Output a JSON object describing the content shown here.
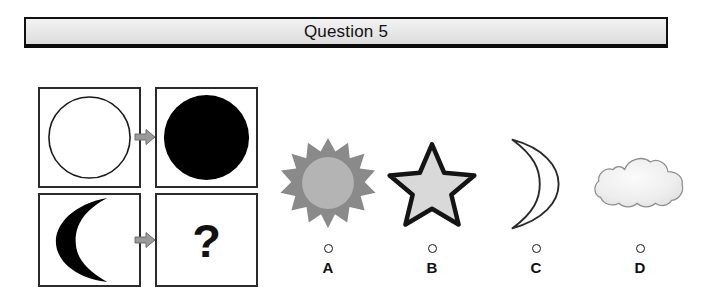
{
  "header": {
    "title": "Question 5"
  },
  "matrix": {
    "name": "analogy-matrix",
    "rows": [
      {
        "source": {
          "shape": "circle-outline",
          "fill": "#ffffff",
          "stroke": "#1a1a1a"
        },
        "arrow": "right-arrow-icon",
        "target": {
          "shape": "circle-filled",
          "fill": "#000000"
        }
      },
      {
        "source": {
          "shape": "crescent-filled",
          "fill": "#000000"
        },
        "arrow": "right-arrow-icon",
        "target": {
          "shape": "question-mark",
          "text": "?"
        }
      }
    ]
  },
  "options": [
    {
      "letter": "A",
      "shape": "sun-icon",
      "ray_color": "#8a8a8a",
      "core_color": "#b4b4b4",
      "selected": false
    },
    {
      "letter": "B",
      "shape": "star-icon",
      "fill_color": "#d9d9d9",
      "stroke_color": "#141414",
      "selected": false
    },
    {
      "letter": "C",
      "shape": "crescent-outline-icon",
      "fill_color": "#ffffff",
      "stroke_color": "#2a2a2a",
      "selected": false
    },
    {
      "letter": "D",
      "shape": "cloud-icon",
      "fill_color": "#efefef",
      "stroke_color": "#8d8d8d",
      "selected": false
    }
  ],
  "colors": {
    "banner_border": "#111111",
    "banner_background": "#e9e9e9",
    "arrow_gray": "#9a9a9a",
    "ink": "#111111"
  }
}
